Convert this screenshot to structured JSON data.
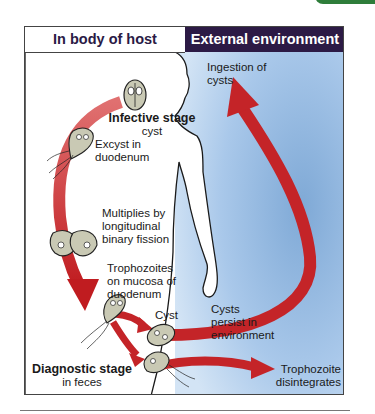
{
  "headers": {
    "left": "In body of host",
    "right": "External environment"
  },
  "labels": {
    "ingestion": [
      "Ingestion of",
      "cysts"
    ],
    "infective_stage_title": "Infective stage",
    "infective_stage_sub": "cyst",
    "excyst": [
      "Excyst in",
      "duodenum"
    ],
    "multiplies": [
      "Multiplies by",
      "longitudinal",
      "binary fission"
    ],
    "trophozoites": [
      "Trophozoites",
      "on mucosa of",
      "duodenum"
    ],
    "cyst": "Cyst",
    "cysts_persist": [
      "Cysts",
      "persist in",
      "environment"
    ],
    "trophozoite_disintegrates": [
      "Trophozoite",
      "disintegrates"
    ],
    "diagnostic_stage_title": "Diagnostic stage",
    "diagnostic_stage_sub": "in feces"
  },
  "colors": {
    "header_dark": "#2c1a45",
    "arrow_red": "#c8282a",
    "arrow_light": "#e06060",
    "env_blue_light": "#c9dff3",
    "env_blue_mid": "#7fa9d6",
    "corner_tab_green": "#2e7d3a"
  }
}
